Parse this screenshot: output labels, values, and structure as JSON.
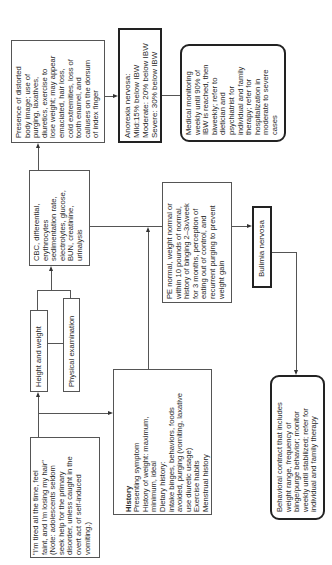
{
  "diagram": {
    "orientation": "rotated-90-ccw",
    "nodes": {
      "presenting_complaint": {
        "text": "\"I'm tired all the time, feel\nfaint, and I'm losing my hair\"\n(Note: adolescents seldom\nseek help for the primary\ndisorder, unless caught in the\novert act of self-induced\nvomiting.)"
      },
      "history": {
        "title": "History",
        "text": "Presenting symptom\nHistory of weight: maximum,\nminimum, ideal\nDietary history:\nintake binges, behaviors, foods\navoided, purging (vomiting, laxative\nuse diuretic usage)\nExercise habits\nMenstrual history"
      },
      "height_weight": {
        "text": "Height and weight"
      },
      "physical_exam": {
        "text": "Physical examination"
      },
      "labs": {
        "text": "CBC, differential,\nerythrocytes\nsedimentation rate,\nelectrolytes, glucose,\nBUN, creatinine,\nurinalysis"
      },
      "anorexia_findings": {
        "text": "Presence of distorted\nbody image; use of\npurging, laxatives,\ndiuretics, exercise to\nlose weight; may appear\nemaciated, hair loss,\ncold extremities, loss of\ntooth enamel, and\ncalluses on the dorsum\nof index finger"
      },
      "anorexia_dx": {
        "text": "Anorexia nervosa:\nMild:15% below IBW\nModerate: 20% below IBW\nSevere: 30% below IBW"
      },
      "anorexia_mgmt": {
        "text": "Medical monitoring\nweekly until 90% of\nIBW is reached, then\nbiweekly; refer to\ndietician and\npsychiatrist for\nindividual and family\ntherapy; refer for\nhospitalization in\nmoderate to severe\ncases"
      },
      "bulimia_findings": {
        "text": "PE normal, weight normal or\nwithin 10 pounds of normal,\nhistory of binging 2–3x/week\nfor 3 months, perception of\neating out of control, and\nrecurrent purging to prevent\nweight gain"
      },
      "bulimia_dx": {
        "text": "Bulimia nervosa"
      },
      "bulimia_mgmt": {
        "text": "Behavioral contract that includes\nweight range, frequency of\nbinge/purge behavior; monitor\nweekly until stabilized; refer for\nindividual and family therapy"
      }
    },
    "edges": [
      {
        "from": "presenting_complaint",
        "to": "height_weight"
      },
      {
        "from": "presenting_complaint",
        "to": "history"
      },
      {
        "from": "height_weight",
        "to": "labs"
      },
      {
        "from": "physical_exam",
        "to": "labs"
      },
      {
        "from": "labs",
        "to": "anorexia_findings"
      },
      {
        "from": "history",
        "to": "labs-junction"
      },
      {
        "from": "labs",
        "to": "bulimia_findings"
      },
      {
        "from": "anorexia_findings",
        "to": "anorexia_dx"
      },
      {
        "from": "anorexia_dx",
        "to": "anorexia_mgmt"
      },
      {
        "from": "bulimia_findings",
        "to": "bulimia_dx"
      },
      {
        "from": "bulimia_dx",
        "to": "bulimia_mgmt"
      }
    ]
  }
}
